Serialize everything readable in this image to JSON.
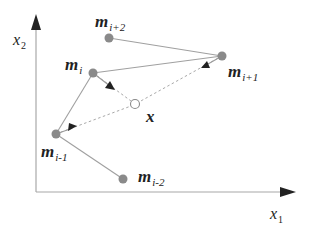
{
  "diagram": {
    "type": "vector-quantization-neighborhood",
    "axes": {
      "x": {
        "label": "x",
        "subscript": "1"
      },
      "y": {
        "label": "x",
        "subscript": "2"
      }
    },
    "points": [
      {
        "id": "m_i_plus_2",
        "label": "m",
        "subscript": "i+2",
        "x": 109,
        "y": 38,
        "style": "filled"
      },
      {
        "id": "m_i",
        "label": "m",
        "subscript": "i",
        "x": 93,
        "y": 73,
        "style": "filled"
      },
      {
        "id": "m_i_plus_1",
        "label": "m",
        "subscript": "i+1",
        "x": 222,
        "y": 56,
        "style": "filled"
      },
      {
        "id": "x",
        "label": "x",
        "subscript": "",
        "x": 135,
        "y": 104,
        "style": "hollow"
      },
      {
        "id": "m_i_minus_1",
        "label": "m",
        "subscript": "i-1",
        "x": 56,
        "y": 134,
        "style": "filled"
      },
      {
        "id": "m_i_minus_2",
        "label": "m",
        "subscript": "i-2",
        "x": 123,
        "y": 179,
        "style": "filled"
      }
    ],
    "solid_edges": [
      [
        "m_i_plus_2",
        "m_i_plus_1"
      ],
      [
        "m_i",
        "m_i_plus_1"
      ],
      [
        "m_i",
        "m_i_minus_1"
      ],
      [
        "m_i_minus_1",
        "m_i_minus_2"
      ]
    ],
    "dashed_edges": [
      [
        "m_i",
        "x"
      ],
      [
        "m_i_plus_1",
        "x"
      ],
      [
        "m_i_minus_1",
        "x"
      ]
    ],
    "arrows_toward_x_from": [
      "m_i",
      "m_i_plus_1",
      "m_i_minus_1"
    ],
    "colors": {
      "node_fill": "#8a8a8a",
      "edge": "#9a9a9a",
      "axis": "#a0a0a0",
      "arrowhead": "#222222",
      "text": "#222222"
    }
  },
  "labels": {
    "m_i_plus_2": {
      "main": "m",
      "sub": "i+2"
    },
    "m_i": {
      "main": "m",
      "sub": "i"
    },
    "m_i_plus_1": {
      "main": "m",
      "sub": "i+1"
    },
    "x": {
      "main": "x"
    },
    "m_i_minus_1": {
      "main": "m",
      "sub": "i-1"
    },
    "m_i_minus_2": {
      "main": "m",
      "sub": "i-2"
    },
    "axis_x": {
      "main": "x",
      "sub": "1"
    },
    "axis_y": {
      "main": "x",
      "sub": "2"
    }
  }
}
